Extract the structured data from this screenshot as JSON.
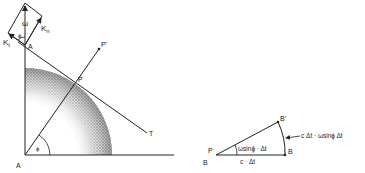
{
  "figure": {
    "left_diagram": {
      "labels": {
        "omega": "ω",
        "phi_top": "ϕ",
        "k_t": "K",
        "k_t_sub": "t",
        "k_n": "K",
        "k_n_sub": "n",
        "a_top": "A",
        "a_bottom": "A",
        "p": "P",
        "p_prime": "P'",
        "t": "T",
        "phi_bottom": "ϕ"
      }
    },
    "right_diagram": {
      "labels": {
        "p": "P",
        "b_left": "B",
        "b_right": "B",
        "b_prime": "B'",
        "angle": "ωsinϕ · Δt",
        "base": "c · Δt",
        "arc": "c Δt · ωsinϕ Δt"
      }
    },
    "colors": {
      "ink": "#222222",
      "stipple": "#444444",
      "background": "#ffffff"
    }
  }
}
